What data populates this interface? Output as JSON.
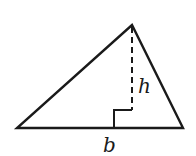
{
  "diagram": {
    "type": "triangle-with-altitude",
    "vertices": {
      "left": [
        17,
        128
      ],
      "right": [
        183,
        128
      ],
      "apex": [
        132,
        25
      ]
    },
    "altitude_foot": [
      132,
      128
    ],
    "right_angle_marker_size": 18,
    "labels": {
      "height": "h",
      "base": "b"
    },
    "stroke_color": "#1a1a1a"
  }
}
